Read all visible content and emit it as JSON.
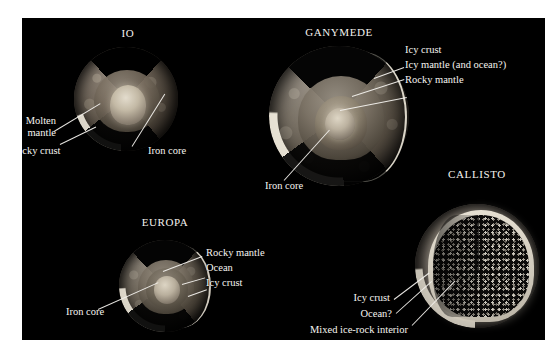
{
  "figure": {
    "background_color": "#000000",
    "page_color": "#ffffff",
    "label_color": "#f6f4f0"
  },
  "moons": [
    {
      "id": "io",
      "title": "IO",
      "labels": [
        {
          "id": "molten-mantle",
          "text_line1": "Molten",
          "text_line2": "mantle"
        },
        {
          "id": "rocky-crust",
          "text_line1": "Rocky crust",
          "text_line2": ""
        },
        {
          "id": "iron-core",
          "text_line1": "Iron core",
          "text_line2": ""
        }
      ]
    },
    {
      "id": "ganymede",
      "title": "GANYMEDE",
      "labels": [
        {
          "id": "icy-crust",
          "text_line1": "Icy crust",
          "text_line2": ""
        },
        {
          "id": "icy-mantle",
          "text_line1": "Icy mantle (and ocean?)",
          "text_line2": ""
        },
        {
          "id": "rocky-mantle",
          "text_line1": "Rocky mantle",
          "text_line2": ""
        },
        {
          "id": "iron-core",
          "text_line1": "Iron core",
          "text_line2": ""
        }
      ]
    },
    {
      "id": "europa",
      "title": "EUROPA",
      "labels": [
        {
          "id": "rocky-mantle",
          "text_line1": "Rocky mantle",
          "text_line2": ""
        },
        {
          "id": "ocean",
          "text_line1": "Ocean",
          "text_line2": ""
        },
        {
          "id": "icy-crust",
          "text_line1": "Icy crust",
          "text_line2": ""
        },
        {
          "id": "iron-core",
          "text_line1": "Iron core",
          "text_line2": ""
        }
      ]
    },
    {
      "id": "callisto",
      "title": "CALLISTO",
      "labels": [
        {
          "id": "icy-crust",
          "text_line1": "Icy crust",
          "text_line2": ""
        },
        {
          "id": "ocean",
          "text_line1": "Ocean?",
          "text_line2": ""
        },
        {
          "id": "mixed-interior",
          "text_line1": "Mixed ice-rock interior",
          "text_line2": ""
        }
      ]
    }
  ]
}
